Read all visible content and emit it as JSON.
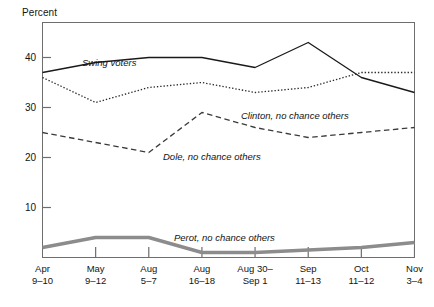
{
  "axis": {
    "ylabel": "Percent",
    "yticks": [
      0,
      10,
      20,
      30,
      40
    ],
    "ytick_labels": [
      "",
      "10",
      "20",
      "30",
      "40"
    ],
    "xtick_labels": [
      {
        "line1": "Apr",
        "line2": "9–10"
      },
      {
        "line1": "May",
        "line2": "9–12"
      },
      {
        "line1": "Aug",
        "line2": "5–7"
      },
      {
        "line1": "Aug",
        "line2": "16–18"
      },
      {
        "line1": "Aug 30–",
        "line2": "Sep 1"
      },
      {
        "line1": "Sep",
        "line2": "11–13"
      },
      {
        "line1": "Oct",
        "line2": "11–12"
      },
      {
        "line1": "Nov",
        "line2": "3–4"
      }
    ]
  },
  "series_labels": [
    {
      "name": "swing-voters",
      "text": "Swing voters",
      "x": 82,
      "y": 57
    },
    {
      "name": "clinton-no-chance-others",
      "text": "Clinton, no chance others",
      "x": 241,
      "y": 110
    },
    {
      "name": "dole-no-chance-others",
      "text": "Dole, no chance others",
      "x": 163,
      "y": 151
    },
    {
      "name": "perot-no-chance-others",
      "text": "Perot, no chance others",
      "x": 174,
      "y": 232
    }
  ],
  "colors": {
    "axis": "#6e6e6e",
    "swing": "#1a1a1a",
    "clinton": "#2b2b2b",
    "dole": "#3a3a3a",
    "perot": "#8c8c8c",
    "text": "#141414"
  },
  "chart_data": {
    "type": "line",
    "title": "",
    "xlabel": "",
    "ylabel": "Percent",
    "ylim": [
      0,
      47
    ],
    "yticks": [
      10,
      20,
      30,
      40
    ],
    "grid": false,
    "legend": "inline-labels",
    "categories": [
      "Apr 9–10",
      "May 9–12",
      "Aug 5–7",
      "Aug 16–18",
      "Aug 30–Sep 1",
      "Sep 11–13",
      "Oct 11–12",
      "Nov 3–4"
    ],
    "series": [
      {
        "name": "Swing voters",
        "style": "solid",
        "values": [
          37,
          39,
          40,
          40,
          38,
          43,
          36,
          33
        ]
      },
      {
        "name": "Clinton, no chance others",
        "style": "dotted",
        "values": [
          36,
          31,
          34,
          35,
          33,
          34,
          37,
          37
        ]
      },
      {
        "name": "Dole, no chance others",
        "style": "dashed",
        "values": [
          25,
          23,
          21,
          29,
          26,
          24,
          25,
          26
        ]
      },
      {
        "name": "Perot, no chance others",
        "style": "thick-gray",
        "values": [
          2,
          4,
          4,
          1,
          1,
          1.5,
          2,
          3
        ]
      }
    ]
  }
}
